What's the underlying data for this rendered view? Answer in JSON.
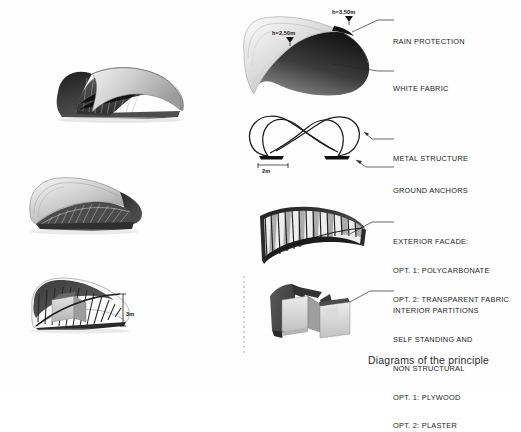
{
  "document": {
    "caption": "Diagrams of the principle"
  },
  "renderings": [
    {
      "name": "pavilion-view-exterior-front",
      "dimension_label": ""
    },
    {
      "name": "pavilion-view-roof-underside",
      "dimension_label": ""
    },
    {
      "name": "pavilion-view-interior-cutaway",
      "dimension_label": "3m"
    }
  ],
  "diagrams": [
    {
      "id": "roof",
      "labels": [
        {
          "text": "RAIN PROTECTION"
        },
        {
          "text": "WHITE FABRIC"
        }
      ],
      "dimensions": [
        {
          "text": "h=3,50m"
        },
        {
          "text": "h=2,50m"
        }
      ]
    },
    {
      "id": "structure",
      "labels": [
        {
          "text": "METAL STRUCTURE"
        },
        {
          "text": "GROUND ANCHORS"
        }
      ],
      "dimensions": [
        {
          "text": "2m"
        }
      ]
    },
    {
      "id": "facade",
      "labels": [
        {
          "text": "EXTERIOR FACADE:"
        },
        {
          "text": "OPT. 1: POLYCARBONATE"
        },
        {
          "text": "OPT. 2: TRANSPARENT FABRIC"
        }
      ],
      "dimensions": []
    },
    {
      "id": "partitions",
      "labels": [
        {
          "text": "INTERIOR PARTITIONS"
        },
        {
          "text": "SELF STANDING AND"
        },
        {
          "text": "NON STRUCTURAL"
        },
        {
          "text": "OPT. 1: PLYWOOD"
        },
        {
          "text": "OPT. 2: PLASTER"
        }
      ],
      "dimensions": []
    }
  ],
  "colors": {
    "ink": "#1a1a1a",
    "fabric_light": "#d9d9d9",
    "fabric_dark": "#3a3a3a",
    "panel_gray": "#9a9a9a",
    "paper": "#ffffff"
  }
}
